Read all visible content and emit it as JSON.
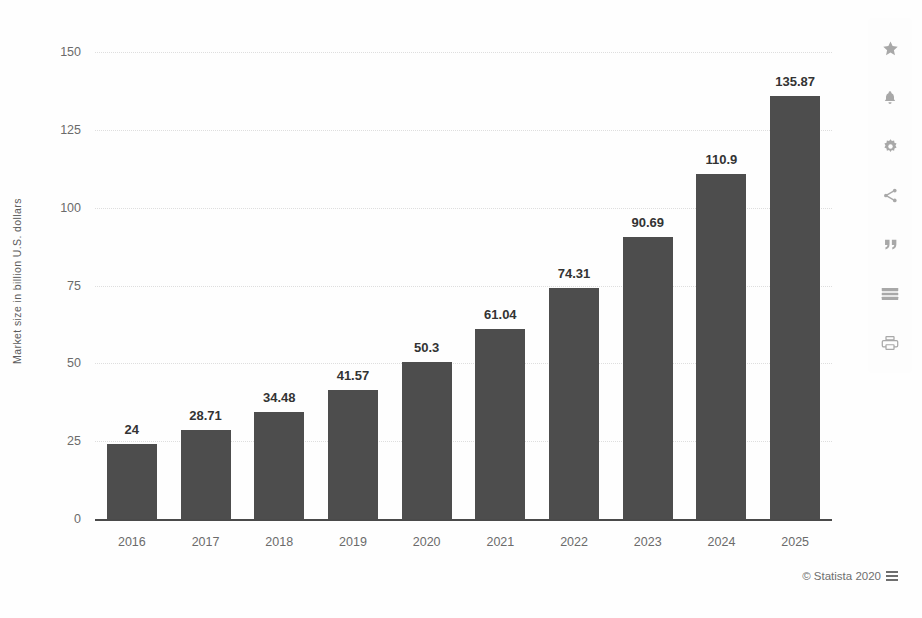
{
  "chart_data": {
    "type": "bar",
    "title": "",
    "xlabel": "",
    "ylabel": "Market size in billion U.S. dollars",
    "categories": [
      "2016",
      "2017",
      "2018",
      "2019",
      "2020",
      "2021",
      "2022",
      "2023",
      "2024",
      "2025"
    ],
    "values": [
      24,
      28.71,
      34.48,
      41.57,
      50.3,
      61.04,
      74.31,
      90.69,
      110.9,
      135.87
    ],
    "value_labels": [
      "24",
      "28.71",
      "34.48",
      "41.57",
      "50.3",
      "61.04",
      "74.31",
      "90.69",
      "110.9",
      "135.87"
    ],
    "ylim": [
      0,
      150
    ],
    "yticks": [
      0,
      25,
      50,
      75,
      100,
      125,
      150
    ],
    "ytick_labels": [
      "0",
      "25",
      "50",
      "75",
      "100",
      "125",
      "150"
    ],
    "grid": true,
    "legend": "none",
    "bar_color": "#4d4d4d"
  },
  "credit": {
    "text": "© Statista 2020",
    "flag_icon": "flag-icon"
  },
  "toolbar": {
    "items": [
      {
        "name": "favorite-button",
        "icon": "star-icon"
      },
      {
        "name": "notification-button",
        "icon": "bell-icon"
      },
      {
        "name": "settings-button",
        "icon": "gear-icon"
      },
      {
        "name": "share-button",
        "icon": "share-icon"
      },
      {
        "name": "citation-button",
        "icon": "quote-icon"
      },
      {
        "name": "table-view-button",
        "icon": "table-icon"
      },
      {
        "name": "print-button",
        "icon": "printer-icon"
      }
    ]
  }
}
